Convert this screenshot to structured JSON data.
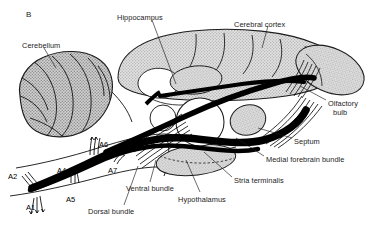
{
  "figure": {
    "panel_letter": "B",
    "background_color": "#ffffff",
    "ink_color": "#1c1c1c",
    "tissue_fill_color": "#c9c9c9",
    "tract_color": "#000000"
  },
  "structure_labels": [
    {
      "id": "cerebellum",
      "text": "Cerebellum",
      "x": 22,
      "y": 42,
      "anchor": "start"
    },
    {
      "id": "hippocampus",
      "text": "Hippocampus",
      "x": 117,
      "y": 14,
      "anchor": "start"
    },
    {
      "id": "cerebral-cortex",
      "text": "Cerebral cortex",
      "x": 234,
      "y": 21,
      "anchor": "start"
    },
    {
      "id": "olfactory-bulb-line1",
      "text": "Olfactory",
      "x": 328,
      "y": 100,
      "anchor": "start"
    },
    {
      "id": "olfactory-bulb-line2",
      "text": "bulb",
      "x": 333,
      "y": 109,
      "anchor": "start"
    },
    {
      "id": "septum",
      "text": "Septum",
      "x": 294,
      "y": 138,
      "anchor": "start"
    },
    {
      "id": "medial-forebrain-bundle",
      "text": "Medial forebrain bundle",
      "x": 266,
      "y": 156,
      "anchor": "start"
    },
    {
      "id": "stria-terminalis",
      "text": "Stria terminalis",
      "x": 234,
      "y": 177,
      "anchor": "start"
    },
    {
      "id": "hypothalamus",
      "text": "Hypothalamus",
      "x": 178,
      "y": 196,
      "anchor": "start"
    },
    {
      "id": "ventral-bundle",
      "text": "Ventral bundle",
      "x": 126,
      "y": 185,
      "anchor": "start"
    },
    {
      "id": "dorsal-bundle",
      "text": "Dorsal bundle",
      "x": 88,
      "y": 208,
      "anchor": "start"
    }
  ],
  "cell_group_labels": [
    {
      "id": "a1",
      "text": "A1",
      "x": 26,
      "y": 203
    },
    {
      "id": "a2",
      "text": "A2",
      "x": 8,
      "y": 172
    },
    {
      "id": "a4",
      "text": "A4",
      "x": 57,
      "y": 166
    },
    {
      "id": "a5",
      "text": "A5",
      "x": 66,
      "y": 195
    },
    {
      "id": "a6",
      "text": "A6",
      "x": 99,
      "y": 140
    },
    {
      "id": "a7",
      "text": "A7",
      "x": 108,
      "y": 166
    }
  ],
  "olfactory_bulb_caption": "Olfactory bulb"
}
